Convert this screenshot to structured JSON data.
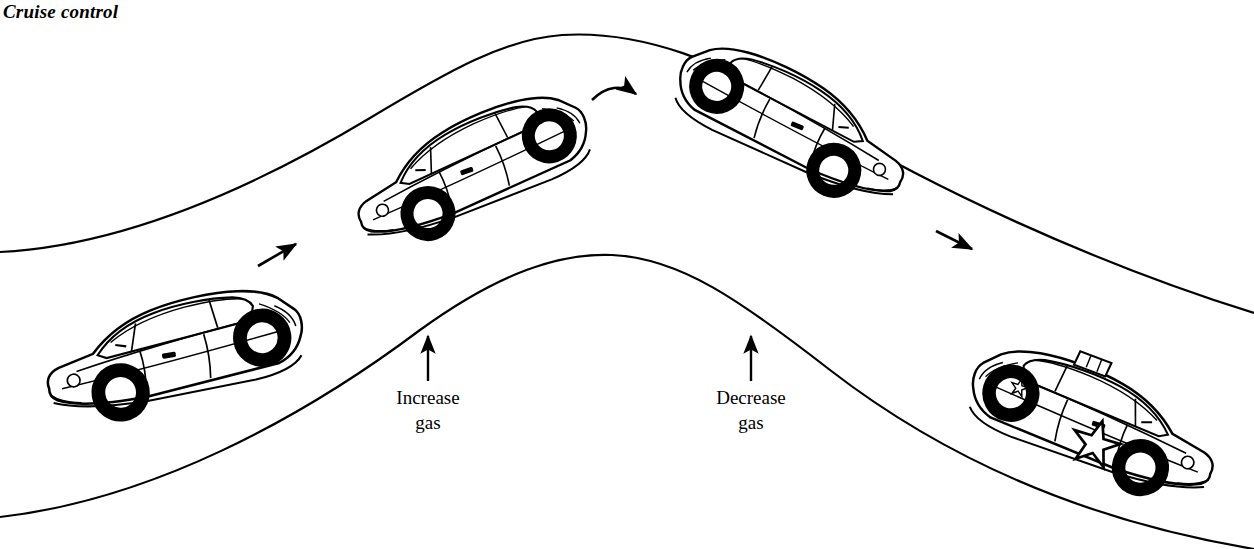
{
  "figure": {
    "title": "Cruise control",
    "type": "technical-illustration",
    "background_color": "#ffffff",
    "line_color": "#000000"
  },
  "annotations": {
    "increase": {
      "line1": "Increase",
      "line2": "gas"
    },
    "decrease": {
      "line1": "Decrease",
      "line2": "gas"
    }
  },
  "arrows": [
    {
      "name": "uphill-direction-arrow",
      "direction": "up-right"
    },
    {
      "name": "crest-direction-arrow",
      "direction": "curved-right"
    },
    {
      "name": "downhill-direction-arrow",
      "direction": "down-right"
    },
    {
      "name": "increase-gas-pointer",
      "direction": "up"
    },
    {
      "name": "decrease-gas-pointer",
      "direction": "up"
    }
  ],
  "vehicles": [
    {
      "name": "car-uphill-bottom",
      "kind": "sedan",
      "facing": "right",
      "slope": "flat-uphill-start"
    },
    {
      "name": "car-uphill-mid",
      "kind": "sedan",
      "facing": "right",
      "slope": "uphill"
    },
    {
      "name": "car-crest-downhill",
      "kind": "sedan",
      "facing": "right",
      "slope": "downhill"
    },
    {
      "name": "car-police-downhill",
      "kind": "police-car",
      "facing": "right",
      "slope": "downhill",
      "markings": "star emblem, roof light bar"
    }
  ]
}
